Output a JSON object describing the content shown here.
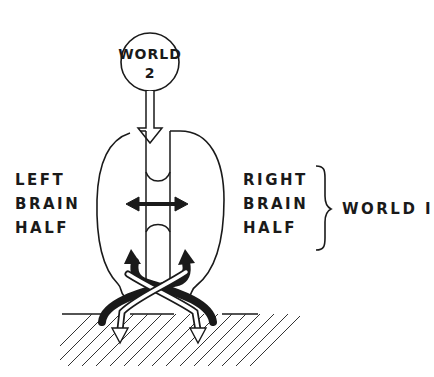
{
  "diagram": {
    "world2_circle": {
      "line1": "WORLD",
      "line2": "2"
    },
    "left_label": {
      "lines": [
        "LEFT",
        "BRAIN",
        "HALF"
      ]
    },
    "right_label": {
      "lines": [
        "RIGHT",
        "BRAIN",
        "HALF"
      ]
    },
    "world1_label": "WORLD I",
    "colors": {
      "ink": "#1a1a1a",
      "background": "#ffffff"
    }
  }
}
